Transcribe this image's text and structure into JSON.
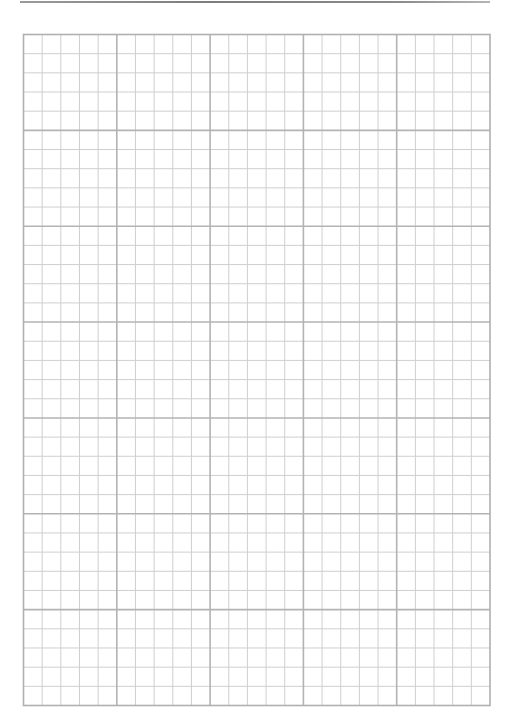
{
  "page": {
    "type": "graph-paper",
    "width": 511,
    "height": 726,
    "background": "#ffffff"
  },
  "header_rule": {
    "color": "#888888"
  },
  "grid": {
    "left": 23.5,
    "top": 34.5,
    "right": 490,
    "bottom": 705.5,
    "major_columns": 5,
    "major_rows": 7,
    "minor_per_major": 5,
    "minor_line_color": "#cfcfcf",
    "major_line_color": "#b3b3b3",
    "border_color": "#b0b0b0",
    "minor_line_width": 1,
    "major_line_width": 1.6
  }
}
